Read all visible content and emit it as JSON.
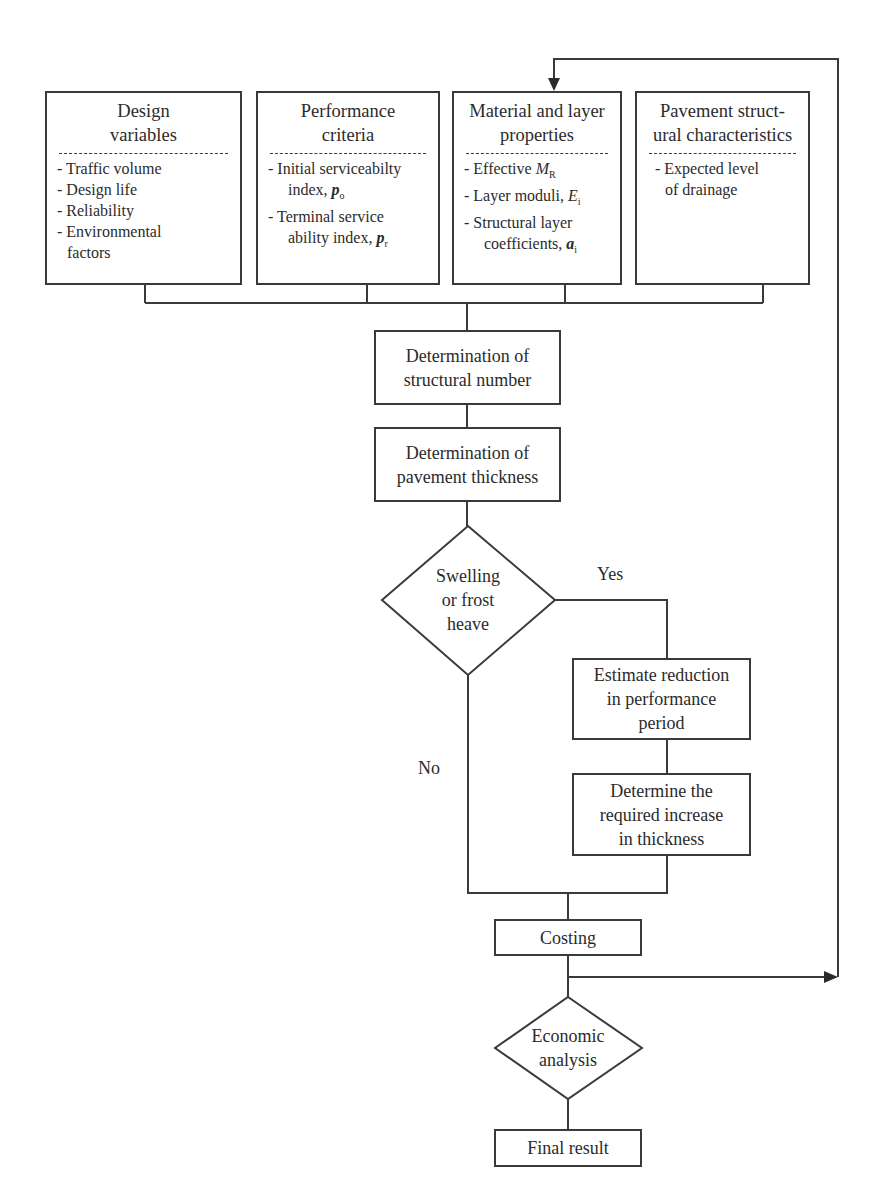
{
  "input_boxes": [
    {
      "title_line1": "Design",
      "title_line2": "variables",
      "items": [
        "- Traffic volume",
        "- Design life",
        "- Reliability",
        "- Environmental",
        "  factors"
      ]
    },
    {
      "title_line1": "Performance",
      "title_line2": "criteria",
      "items": [
        {
          "text": "- Initial serviceabilty",
          "cont": "index, ",
          "var": "p",
          "sub": "o"
        },
        {
          "text": "- Terminal service",
          "cont": "ability index, ",
          "var": "p",
          "sub": "r"
        }
      ]
    },
    {
      "title_line1": "Material and layer",
      "title_line2": "properties",
      "items": [
        {
          "text": "- Effective ",
          "var": "M",
          "sub": "R"
        },
        {
          "text": "- Layer moduli, ",
          "var": "E",
          "sub": "i"
        },
        {
          "text": "- Structural layer",
          "cont": "coefficients, ",
          "var": "a",
          "sub": "i"
        }
      ]
    },
    {
      "title_line1": "Pavement struct-",
      "title_line2": "ural characteristics",
      "items": [
        "- Expected level",
        "of drainage"
      ]
    }
  ],
  "process": {
    "structural_number": {
      "line1": "Determination of",
      "line2": "structural number"
    },
    "pavement_thickness": {
      "line1": "Determination of",
      "line2": "pavement thickness"
    },
    "estimate_reduction": {
      "line1": "Estimate reduction",
      "line2": "in performance",
      "line3": "period"
    },
    "increase_thickness": {
      "line1": "Determine the",
      "line2": "required increase",
      "line3": "in thickness"
    },
    "costing": {
      "line1": "Costing"
    },
    "final_result": {
      "line1": "Final result"
    }
  },
  "decisions": {
    "swelling": {
      "line1": "Swelling",
      "line2": "or frost",
      "line3": "heave"
    },
    "economic": {
      "line1": "Economic",
      "line2": "analysis"
    }
  },
  "edge_labels": {
    "yes": "Yes",
    "no": "No"
  }
}
